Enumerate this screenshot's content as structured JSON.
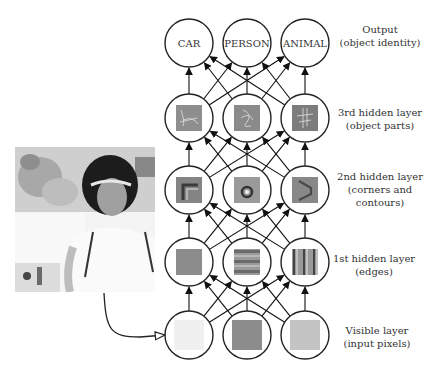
{
  "layers": [
    {
      "name": "Output",
      "description": "(object identity)",
      "nodes": [
        "CAR",
        "PERSON",
        "ANIMAL"
      ],
      "kind": "text"
    },
    {
      "name": "3rd hidden layer",
      "description": "(object parts)",
      "nodes": [
        "object-part-feature-1",
        "object-part-feature-2",
        "object-part-feature-3"
      ],
      "kind": "feature"
    },
    {
      "name": "2nd hidden layer",
      "description_lines": [
        "(corners and",
        "contours)"
      ],
      "nodes": [
        "corner-feature",
        "contour-circle-feature",
        "contour-curve-feature"
      ],
      "kind": "feature"
    },
    {
      "name": "1st hidden layer",
      "description": "(edges)",
      "nodes": [
        "uniform-edge-feature",
        "horizontal-edge-feature",
        "vertical-edge-feature"
      ],
      "kind": "feature"
    },
    {
      "name": "Visible layer",
      "description": "(input pixels)",
      "nodes": [
        "light-pixel-patch",
        "dark-pixel-patch",
        "medium-pixel-patch"
      ],
      "kind": "pixel"
    }
  ],
  "output_nodes": [
    "CAR",
    "PERSON",
    "ANIMAL"
  ],
  "labels": {
    "output_title": "Output",
    "output_sub": "(object identity)",
    "h3_title": "3rd hidden layer",
    "h3_sub": "(object parts)",
    "h2_title": "2nd hidden layer",
    "h2_sub1": "(corners and",
    "h2_sub2": "contours)",
    "h1_title": "1st hidden layer",
    "h1_sub": "(edges)",
    "vis_title": "Visible layer",
    "vis_sub": "(input pixels)"
  },
  "colors": {
    "stroke": "#222222",
    "text": "#333333",
    "feature_bg": "#8a8a8a",
    "pixel_light": "#f0f0f0",
    "pixel_dark": "#8c8c8c",
    "pixel_medium": "#c4c4c4"
  },
  "input_image": "grayscale photo of a person with a visor"
}
